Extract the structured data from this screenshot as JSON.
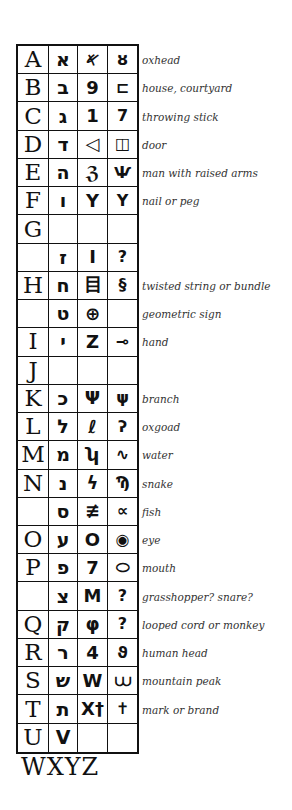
{
  "columns": [
    "Latin",
    "Hebrew",
    "Early Semitic",
    "Pictograph"
  ],
  "rows": [
    {
      "latin": "A",
      "hebrew": "א",
      "semitic": "𐤀",
      "picto": "ȣ",
      "description": "oxhead"
    },
    {
      "latin": "B",
      "hebrew": "ב",
      "semitic": "9",
      "picto": "⊏",
      "description": "house, courtyard"
    },
    {
      "latin": "C",
      "hebrew": "ג",
      "semitic": "1",
      "picto": "7",
      "description": "throwing stick"
    },
    {
      "latin": "D",
      "hebrew": "ד",
      "semitic": "◁",
      "picto": "◫",
      "description": "door"
    },
    {
      "latin": "E",
      "hebrew": "ה",
      "semitic": "ℨ",
      "picto": "Ѱ",
      "description": "man with raised arms"
    },
    {
      "latin": "F",
      "hebrew": "ו",
      "semitic": "Y",
      "picto": "Y",
      "description": "nail or peg"
    },
    {
      "latin": "G",
      "hebrew": "",
      "semitic": "",
      "picto": "",
      "description": ""
    },
    {
      "latin": "",
      "hebrew": "ז",
      "semitic": "I",
      "picto": "?",
      "description": ""
    },
    {
      "latin": "H",
      "hebrew": "ח",
      "semitic": "目",
      "picto": "§",
      "description": "twisted string or bundle"
    },
    {
      "latin": "",
      "hebrew": "ט",
      "semitic": "⊕",
      "picto": "",
      "description": "geometric sign"
    },
    {
      "latin": "I",
      "hebrew": "י",
      "semitic": "Z",
      "picto": "⊸",
      "description": "hand"
    },
    {
      "latin": "J",
      "hebrew": "",
      "semitic": "",
      "picto": "",
      "description": ""
    },
    {
      "latin": "K",
      "hebrew": "כ",
      "semitic": "Ψ",
      "picto": "ψ",
      "description": "branch"
    },
    {
      "latin": "L",
      "hebrew": "ל",
      "semitic": "ℓ",
      "picto": "ʔ",
      "description": "oxgoad"
    },
    {
      "latin": "M",
      "hebrew": "מ",
      "semitic": "ʮ",
      "picto": "∿",
      "description": "water"
    },
    {
      "latin": "N",
      "hebrew": "נ",
      "semitic": "ϟ",
      "picto": "Ϡ",
      "description": "snake"
    },
    {
      "latin": "",
      "hebrew": "ס",
      "semitic": "≢",
      "picto": "∝",
      "description": "fish"
    },
    {
      "latin": "O",
      "hebrew": "ע",
      "semitic": "O",
      "picto": "◉",
      "description": "eye"
    },
    {
      "latin": "P",
      "hebrew": "פ",
      "semitic": "7",
      "picto": "⬭",
      "description": "mouth"
    },
    {
      "latin": "",
      "hebrew": "צ",
      "semitic": "M",
      "picto": "?",
      "description": "grasshopper? snare?"
    },
    {
      "latin": "Q",
      "hebrew": "ק",
      "semitic": "φ",
      "picto": "?",
      "description": "looped cord or monkey"
    },
    {
      "latin": "R",
      "hebrew": "ר",
      "semitic": "4",
      "picto": "ϑ",
      "description": "human head"
    },
    {
      "latin": "S",
      "hebrew": "ש",
      "semitic": "W",
      "picto": "⩊",
      "description": "mountain peak"
    },
    {
      "latin": "T",
      "hebrew": "ת",
      "semitic": "X†",
      "picto": "✝",
      "description": "mark or brand"
    },
    {
      "latin": "U",
      "hebrew": "V",
      "semitic": "",
      "picto": "",
      "description": ""
    }
  ],
  "footer": "WXYZ"
}
